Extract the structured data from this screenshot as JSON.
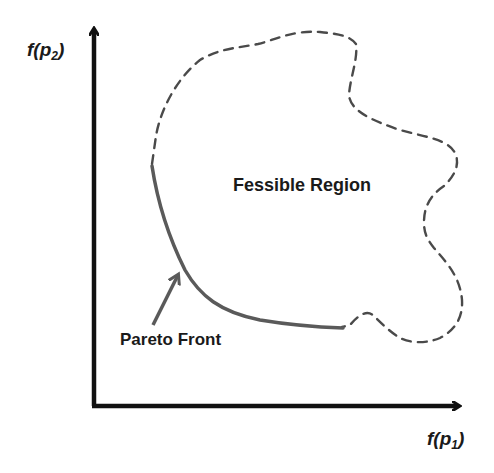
{
  "diagram": {
    "y_axis": {
      "label_main": "f(p",
      "label_sub": "2",
      "label_close": ")"
    },
    "x_axis": {
      "label_main": "f(p",
      "label_sub": "1",
      "label_close": ")"
    },
    "region_label": "Fessible Region",
    "front_label": "Pareto Front",
    "colors": {
      "axis": "#111111",
      "region_boundary": "#4a4a4a",
      "pareto_front": "#5a5a5a",
      "pointer_arrow": "#5a5a5a",
      "text": "#1a1a1a",
      "background": "#ffffff"
    },
    "boundary_style": "dashed",
    "front_style": "solid"
  }
}
